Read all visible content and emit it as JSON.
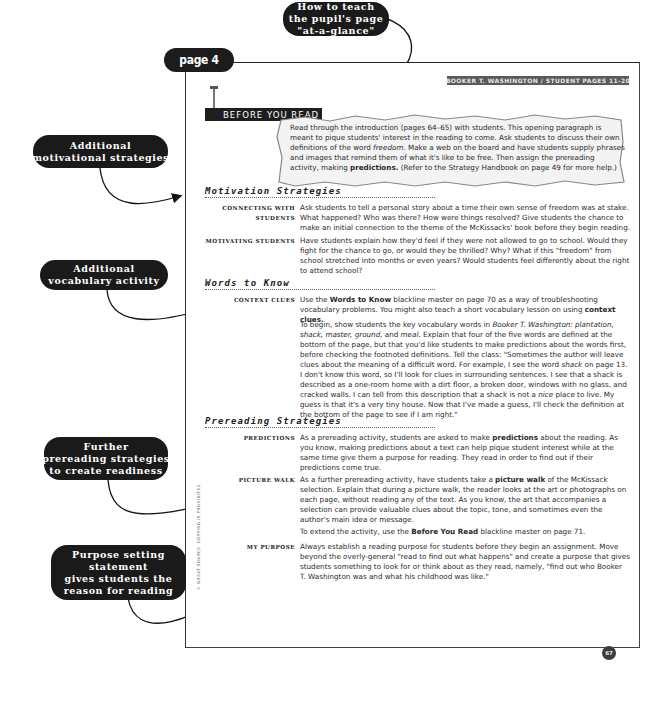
{
  "page_tab": "page 4",
  "header_label": "BOOKER T. WASHINGTON / STUDENT PAGES 11-20",
  "section_title": "BEFORE YOU READ",
  "callouts": {
    "at_a_glance": [
      "How to teach",
      "the pupil's page",
      "\"at-a-glance\""
    ],
    "motivational": [
      "Additional",
      "motivational strategies"
    ],
    "vocabulary": [
      "Additional",
      "vocabulary activity"
    ],
    "prereading": [
      "Further",
      "prereading strategies",
      "to create readiness"
    ],
    "purpose": [
      "Purpose setting",
      "statement",
      "gives students the",
      "reason for reading"
    ]
  },
  "intro": {
    "text_1": "Read through the introduction (pages 64–65) with students. This opening paragraph is meant to pique students' interest in the reading to come. Ask students to discuss their own definitions of the word ",
    "italic_1": "freedom",
    "text_2": ". Make a web on the board and have students supply phrases and images that remind them of what it's like to be free. Then assign the prereading activity, making ",
    "bold_1": "predictions.",
    "text_3": " (Refer to the Strategy Handbook on page 49 for more help.)"
  },
  "motivation": {
    "heading": "Motivation Strategies",
    "items": [
      {
        "term": "Connecting with students",
        "text": "Ask students to tell a personal story about a time their own sense of freedom was at stake. What happened? Who was there? How were things resolved? Give students the chance to make an initial connection to the theme of the McKissacks' book before they begin reading."
      },
      {
        "term": "Motivating students",
        "text": "Have students explain how they'd feel if they were not allowed to go to school. Would they fight for the chance to go, or would they be thrilled? Why? What if this \"freedom\" from school stretched into months or even years? Would students feel differently about the right to attend school?"
      }
    ]
  },
  "words": {
    "heading": "Words to Know",
    "term": "Context clues",
    "p1_a": "Use the ",
    "p1_bold": "Words to Know",
    "p1_b": " blackline master on page 70 as a way of troubleshooting vocabulary problems. You might also teach a short vocabulary lesson on using ",
    "p1_bold2": "context clues.",
    "p2_a": "To begin, show students the key vocabulary words in ",
    "p2_italic": "Booker T. Washington: plantation, shack, master, ground,",
    "p2_b": " and ",
    "p2_italic2": "meal.",
    "p2_c": " Explain that four of the five words are defined at the bottom of the page, but that you'd like students to make predictions about the words first, before checking the footnoted definitions. Tell the class: \"Sometimes the author will leave clues about the meaning of a difficult word. For example, I see the word ",
    "p2_italic3": "shack",
    "p2_d": " on page 13. I don't know this word, so I'll look for clues in surrounding sentences. I see that a shack is described as a one-room home with a dirt floor, a broken door, windows with no glass, and cracked walls. I can tell from this description that a shack is not a ",
    "p2_italic4": "nice",
    "p2_e": " place to live. My guess is that it's a very tiny house. Now that I've made a guess, I'll check the definition at the bottom of the page to see if I am right.\""
  },
  "prereading": {
    "heading": "Prereading Strategies",
    "predictions_term": "Predictions",
    "predictions_a": "As a prereading activity, students are asked to make ",
    "predictions_bold": "predictions",
    "predictions_b": " about the reading. As you know, making predictions about a text can help pique student interest while at the same time give them a purpose for reading. They read in order to find out if their predictions come true.",
    "walk_term": "Picture walk",
    "walk_a": "As a further prereading activity, have students take a ",
    "walk_bold": "picture walk",
    "walk_b": " of the McKissack selection. Explain that during a picture walk, the reader looks at the art or photographs on each page, without reading any of the text. As you know, the art that accompanies a selection can provide valuable clues about the topic, tone, and sometimes even the author's main idea or message.",
    "extend_a": "To extend the activity, use the ",
    "extend_bold": "Before You Read",
    "extend_b": " blackline master on page 71.",
    "purpose_term": "My purpose",
    "purpose_text": "Always establish a reading purpose for students before they begin an assignment. Move beyond the overly-general \"read to find out what happens\" and create a purpose that gives students something to look for or think about as they read, namely, \"find out who Booker T. Washington was and what his childhood was like.\""
  },
  "copyright": "© GREAT SOURCE. COPYING IS PROHIBITED.",
  "page_number": "67"
}
